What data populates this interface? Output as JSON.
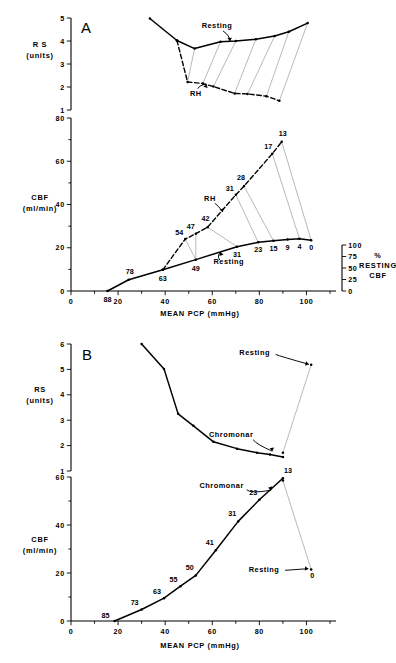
{
  "figure": {
    "panels": [
      "A",
      "B"
    ],
    "x_axis_title": "MEAN  PCP   (mmHg)",
    "rs_axis_label_line1": "R S",
    "rs_axis_label_line2": "(units)",
    "cbf_axis_label_line1": "CBF",
    "cbf_axis_label_line2": "(ml/min)",
    "pct_axis_label_line1": "%",
    "pct_axis_label_line2": "RESTING",
    "pct_axis_label_line3": "CBF"
  },
  "panelA": {
    "label": "A",
    "rs_plot": {
      "ylabel_1": "R S",
      "ylabel_2": "(units)",
      "yticks": [
        "5",
        "4",
        "3",
        "2",
        "1"
      ],
      "ylim": [
        1,
        5
      ],
      "xlim": [
        0,
        110
      ],
      "annotations": [
        {
          "text": "Resting",
          "x": 62,
          "y": 4.55
        },
        {
          "text": "RH",
          "x": 53,
          "y": 1.62
        }
      ],
      "series": [
        {
          "name": "Resting",
          "style": "solid",
          "points": [
            {
              "x": 33.5,
              "y": 4.98
            },
            {
              "x": 45.0,
              "y": 4.02
            },
            {
              "x": 52.5,
              "y": 3.67
            },
            {
              "x": 63.5,
              "y": 3.97
            },
            {
              "x": 70.0,
              "y": 4.0
            },
            {
              "x": 78.5,
              "y": 4.08
            },
            {
              "x": 86.5,
              "y": 4.22
            },
            {
              "x": 92.5,
              "y": 4.4
            },
            {
              "x": 100.5,
              "y": 4.78
            }
          ]
        },
        {
          "name": "RH",
          "style": "dashed",
          "points": [
            {
              "x": 45.0,
              "y": 4.02
            },
            {
              "x": 49.5,
              "y": 2.22
            },
            {
              "x": 56.0,
              "y": 2.15
            },
            {
              "x": 60.5,
              "y": 2.02
            },
            {
              "x": 69.5,
              "y": 1.72
            },
            {
              "x": 75.0,
              "y": 1.7
            },
            {
              "x": 83.0,
              "y": 1.6
            },
            {
              "x": 88.5,
              "y": 1.4
            }
          ]
        }
      ],
      "links": [
        {
          "x1": 52.5,
          "y1": 3.67,
          "x2": 49.5,
          "y2": 2.22
        },
        {
          "x1": 63.5,
          "y1": 3.97,
          "x2": 56.0,
          "y2": 2.15
        },
        {
          "x1": 70.0,
          "y1": 4.0,
          "x2": 60.5,
          "y2": 2.02
        },
        {
          "x1": 78.5,
          "y1": 4.08,
          "x2": 69.5,
          "y2": 1.72
        },
        {
          "x1": 86.5,
          "y1": 4.22,
          "x2": 75.0,
          "y2": 1.7
        },
        {
          "x1": 92.5,
          "y1": 4.4,
          "x2": 83.0,
          "y2": 1.6
        },
        {
          "x1": 100.5,
          "y1": 4.78,
          "x2": 88.5,
          "y2": 1.4
        }
      ]
    },
    "cbf_plot": {
      "ylabel_1": "CBF",
      "ylabel_2": "(ml/min)",
      "yticks": [
        "80",
        "60",
        "40",
        "20",
        "0"
      ],
      "ylim": [
        0,
        80
      ],
      "xticks": [
        "0",
        "20",
        "40",
        "60",
        "80",
        "100"
      ],
      "xlim": [
        0,
        110
      ],
      "right_axis": {
        "ticks": [
          "100",
          "75",
          "50",
          "25",
          "0"
        ],
        "label_1": "%",
        "label_2": "RESTING",
        "label_3": "CBF"
      },
      "annotations": [
        {
          "text": "RH",
          "x": 59,
          "y": 41.5
        },
        {
          "text": "Resting",
          "x": 67,
          "y": 12.5
        }
      ],
      "series": [
        {
          "name": "Resting",
          "style": "solid",
          "points": [
            {
              "x": 15.5,
              "y": 0.0,
              "label": "88"
            },
            {
              "x": 24.5,
              "y": 5.2,
              "label": "78"
            },
            {
              "x": 39.0,
              "y": 9.8,
              "label": "63"
            },
            {
              "x": 53.0,
              "y": 14.5,
              "label": "49"
            },
            {
              "x": 70.5,
              "y": 20.5,
              "label": "31"
            },
            {
              "x": 79.5,
              "y": 22.5,
              "label": "23"
            },
            {
              "x": 86.0,
              "y": 23.2,
              "label": "15"
            },
            {
              "x": 92.0,
              "y": 23.8,
              "label": "9"
            },
            {
              "x": 97.0,
              "y": 24.2,
              "label": "4"
            },
            {
              "x": 102.0,
              "y": 23.5,
              "label": "0"
            }
          ]
        },
        {
          "name": "RH",
          "style": "dashed",
          "points": [
            {
              "x": 39.0,
              "y": 9.8
            },
            {
              "x": 48.5,
              "y": 24.0,
              "label": "54"
            },
            {
              "x": 53.0,
              "y": 26.5,
              "label": "47"
            },
            {
              "x": 58.0,
              "y": 29.5,
              "label": "42"
            },
            {
              "x": 70.0,
              "y": 44.5,
              "label": "31"
            },
            {
              "x": 73.5,
              "y": 48.5,
              "label": "28"
            },
            {
              "x": 85.5,
              "y": 63.5,
              "label": "17"
            },
            {
              "x": 89.5,
              "y": 69.0,
              "label": "13"
            }
          ]
        }
      ],
      "links": [
        {
          "x1": 53.0,
          "y1": 14.5,
          "x2": 48.5,
          "y2": 24.0
        },
        {
          "x1": 53.0,
          "y1": 14.5,
          "x2": 53.0,
          "y2": 26.5
        },
        {
          "x1": 70.5,
          "y1": 20.5,
          "x2": 58.0,
          "y2": 29.5
        },
        {
          "x1": 79.5,
          "y1": 22.5,
          "x2": 70.0,
          "y2": 44.5
        },
        {
          "x1": 86.0,
          "y1": 23.2,
          "x2": 73.5,
          "y2": 48.5
        },
        {
          "x1": 97.0,
          "y1": 24.2,
          "x2": 85.5,
          "y2": 63.5
        },
        {
          "x1": 102.0,
          "y1": 23.5,
          "x2": 89.5,
          "y2": 69.0
        }
      ]
    }
  },
  "panelB": {
    "label": "B",
    "rs_plot": {
      "ylabel_1": "RS",
      "ylabel_2": "(units)",
      "yticks": [
        "6",
        "5",
        "4",
        "3",
        "2",
        "1"
      ],
      "ylim": [
        1,
        6
      ],
      "xlim": [
        0,
        110
      ],
      "annotations": [
        {
          "text": "Resting",
          "x": 78,
          "y": 5.55
        },
        {
          "text": "Chromonar",
          "x": 68,
          "y": 2.35
        }
      ],
      "series": [
        {
          "name": "Chromonar",
          "style": "solid",
          "points": [
            {
              "x": 30.0,
              "y": 6.0
            },
            {
              "x": 39.5,
              "y": 5.02
            },
            {
              "x": 45.5,
              "y": 3.25
            },
            {
              "x": 52.0,
              "y": 2.78
            },
            {
              "x": 60.5,
              "y": 2.15
            },
            {
              "x": 70.5,
              "y": 1.88
            },
            {
              "x": 79.0,
              "y": 1.72
            },
            {
              "x": 84.5,
              "y": 1.65
            },
            {
              "x": 90.0,
              "y": 1.55
            }
          ]
        },
        {
          "name": "Resting",
          "style": "thin",
          "points": [
            {
              "x": 90.0,
              "y": 1.72
            },
            {
              "x": 102.0,
              "y": 5.18
            }
          ]
        }
      ]
    },
    "cbf_plot": {
      "ylabel_1": "CBF",
      "ylabel_2": "(ml/min)",
      "yticks": [
        "60",
        "40",
        "20",
        "0"
      ],
      "ylim": [
        0,
        60
      ],
      "xticks": [
        "0",
        "20",
        "40",
        "60",
        "80",
        "100"
      ],
      "xlim": [
        0,
        110
      ],
      "annotations": [
        {
          "text": "Chromonar",
          "x": 64,
          "y": 55.5
        },
        {
          "text": "Resting",
          "x": 82,
          "y": 20.5
        }
      ],
      "series": [
        {
          "name": "Chromonar",
          "style": "solid",
          "points": [
            {
              "x": 18.5,
              "y": 0.0,
              "label": "85"
            },
            {
              "x": 30.0,
              "y": 4.8,
              "label": "73"
            },
            {
              "x": 39.5,
              "y": 9.5,
              "label": "63"
            },
            {
              "x": 46.5,
              "y": 14.5,
              "label": "55"
            },
            {
              "x": 53.0,
              "y": 19.0,
              "label": "50"
            },
            {
              "x": 61.5,
              "y": 29.5,
              "label": "41"
            },
            {
              "x": 71.0,
              "y": 41.5,
              "label": "31"
            },
            {
              "x": 80.0,
              "y": 50.5,
              "label": "23"
            },
            {
              "x": 90.0,
              "y": 59.5,
              "label": "13"
            }
          ]
        },
        {
          "name": "Resting",
          "style": "thin",
          "points": [
            {
              "x": 90.0,
              "y": 58.5
            },
            {
              "x": 102.0,
              "y": 21.5,
              "label": "0"
            }
          ]
        }
      ]
    }
  }
}
